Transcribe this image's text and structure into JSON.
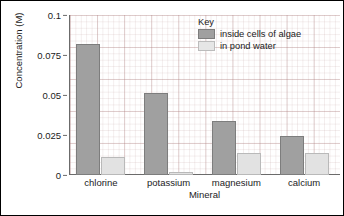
{
  "chart_data": {
    "type": "bar",
    "title": "",
    "xlabel": "Mineral",
    "ylabel": "Concentration (M)",
    "categories": [
      "chlorine",
      "potassium",
      "magnesium",
      "calcium"
    ],
    "series": [
      {
        "name": "inside cells of algae",
        "values": [
          0.082,
          0.051,
          0.034,
          0.0245
        ],
        "color": "#a0a0a0"
      },
      {
        "name": "in pond water",
        "values": [
          0.011,
          0.002,
          0.014,
          0.0135
        ],
        "color": "#e2e2e2"
      }
    ],
    "ylim": [
      0,
      0.1
    ],
    "yticks": [
      "0",
      "0.025",
      "0.05",
      "0.075",
      "0.1"
    ],
    "ytick_values": [
      0,
      0.025,
      0.05,
      0.075,
      0.1
    ],
    "grid": true,
    "legend_position": "top-right",
    "legend_title": "Key"
  },
  "axes": {
    "y_title": "Concentration (M)",
    "x_title": "Mineral"
  },
  "legend": {
    "title": "Key",
    "entries": [
      {
        "label": "inside cells of algae"
      },
      {
        "label": "in pond water"
      }
    ]
  }
}
